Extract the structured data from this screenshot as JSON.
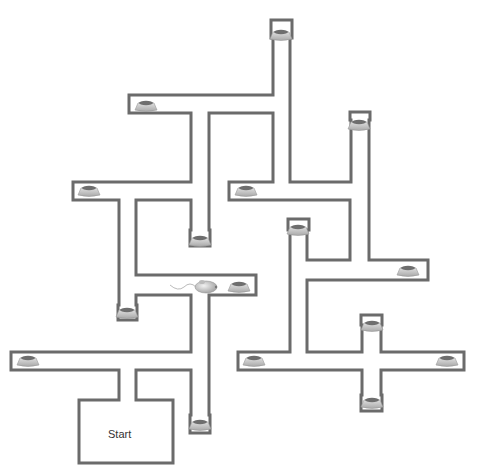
{
  "diagram": {
    "wall_color": "#6b6b6b",
    "start_label": "Start",
    "start_label_pos": {
      "x": 108,
      "y": 428
    },
    "walls": [
      [
        [
          273,
          95
        ],
        [
          273,
          38
        ],
        [
          271,
          38
        ],
        [
          271,
          20
        ],
        [
          292,
          20
        ],
        [
          292,
          38
        ],
        [
          290,
          38
        ],
        [
          290,
          182
        ],
        [
          351,
          182
        ],
        [
          351,
          120
        ],
        [
          350,
          120
        ],
        [
          350,
          112
        ],
        [
          370,
          112
        ],
        [
          370,
          120
        ],
        [
          369,
          120
        ],
        [
          369,
          260
        ],
        [
          428,
          260
        ],
        [
          428,
          280
        ],
        [
          307,
          280
        ],
        [
          307,
          352
        ],
        [
          362,
          352
        ],
        [
          362,
          325
        ],
        [
          361,
          325
        ],
        [
          361,
          315
        ],
        [
          382,
          315
        ],
        [
          382,
          325
        ],
        [
          381,
          325
        ],
        [
          381,
          352
        ],
        [
          464,
          352
        ],
        [
          464,
          370
        ],
        [
          381,
          370
        ],
        [
          381,
          395
        ],
        [
          382,
          395
        ],
        [
          382,
          411
        ],
        [
          361,
          411
        ],
        [
          361,
          395
        ],
        [
          362,
          395
        ],
        [
          362,
          370
        ],
        [
          238,
          370
        ],
        [
          238,
          352
        ],
        [
          290,
          352
        ],
        [
          290,
          230
        ],
        [
          288,
          230
        ],
        [
          288,
          219
        ],
        [
          309,
          219
        ],
        [
          309,
          230
        ],
        [
          307,
          230
        ],
        [
          307,
          260
        ],
        [
          350,
          260
        ],
        [
          350,
          200
        ],
        [
          229,
          200
        ],
        [
          229,
          182
        ],
        [
          273,
          182
        ],
        [
          273,
          113
        ],
        [
          209,
          113
        ],
        [
          209,
          230
        ],
        [
          210,
          230
        ],
        [
          210,
          246
        ],
        [
          190,
          246
        ],
        [
          190,
          230
        ],
        [
          191,
          230
        ],
        [
          191,
          200
        ],
        [
          136,
          200
        ],
        [
          136,
          275
        ],
        [
          256,
          275
        ],
        [
          256,
          295
        ],
        [
          209,
          295
        ],
        [
          209,
          415
        ],
        [
          210,
          415
        ],
        [
          210,
          433
        ],
        [
          190,
          433
        ],
        [
          190,
          415
        ],
        [
          191,
          415
        ],
        [
          191,
          370
        ],
        [
          136,
          370
        ],
        [
          136,
          400
        ],
        [
          173,
          400
        ],
        [
          173,
          463
        ],
        [
          79,
          463
        ],
        [
          79,
          400
        ],
        [
          119,
          400
        ],
        [
          119,
          370
        ],
        [
          11,
          370
        ],
        [
          11,
          352
        ],
        [
          191,
          352
        ],
        [
          191,
          295
        ],
        [
          136,
          295
        ],
        [
          136,
          305
        ],
        [
          137,
          305
        ],
        [
          137,
          320
        ],
        [
          118,
          320
        ],
        [
          118,
          305
        ],
        [
          119,
          305
        ],
        [
          119,
          200
        ],
        [
          73,
          200
        ],
        [
          73,
          182
        ],
        [
          191,
          182
        ],
        [
          191,
          113
        ],
        [
          129,
          113
        ],
        [
          129,
          95
        ],
        [
          273,
          95
        ]
      ]
    ],
    "bowls": [
      {
        "id": "top",
        "x": 281,
        "y": 35
      },
      {
        "id": "upper-left",
        "x": 146,
        "y": 106
      },
      {
        "id": "upper-right",
        "x": 359,
        "y": 125
      },
      {
        "id": "left",
        "x": 89,
        "y": 191
      },
      {
        "id": "center-upper",
        "x": 246,
        "y": 191
      },
      {
        "id": "center-drop",
        "x": 200,
        "y": 241
      },
      {
        "id": "right-upper",
        "x": 298,
        "y": 230
      },
      {
        "id": "right-arm",
        "x": 408,
        "y": 271
      },
      {
        "id": "mouse-arm",
        "x": 239,
        "y": 287
      },
      {
        "id": "left-drop",
        "x": 127,
        "y": 313
      },
      {
        "id": "cross-top",
        "x": 372,
        "y": 326
      },
      {
        "id": "far-left",
        "x": 28,
        "y": 361
      },
      {
        "id": "cross-left",
        "x": 254,
        "y": 361
      },
      {
        "id": "cross-right",
        "x": 447,
        "y": 361
      },
      {
        "id": "bottom-drop",
        "x": 200,
        "y": 425
      },
      {
        "id": "cross-bottom",
        "x": 372,
        "y": 403
      }
    ],
    "mouse": {
      "x": 206,
      "y": 287
    }
  }
}
